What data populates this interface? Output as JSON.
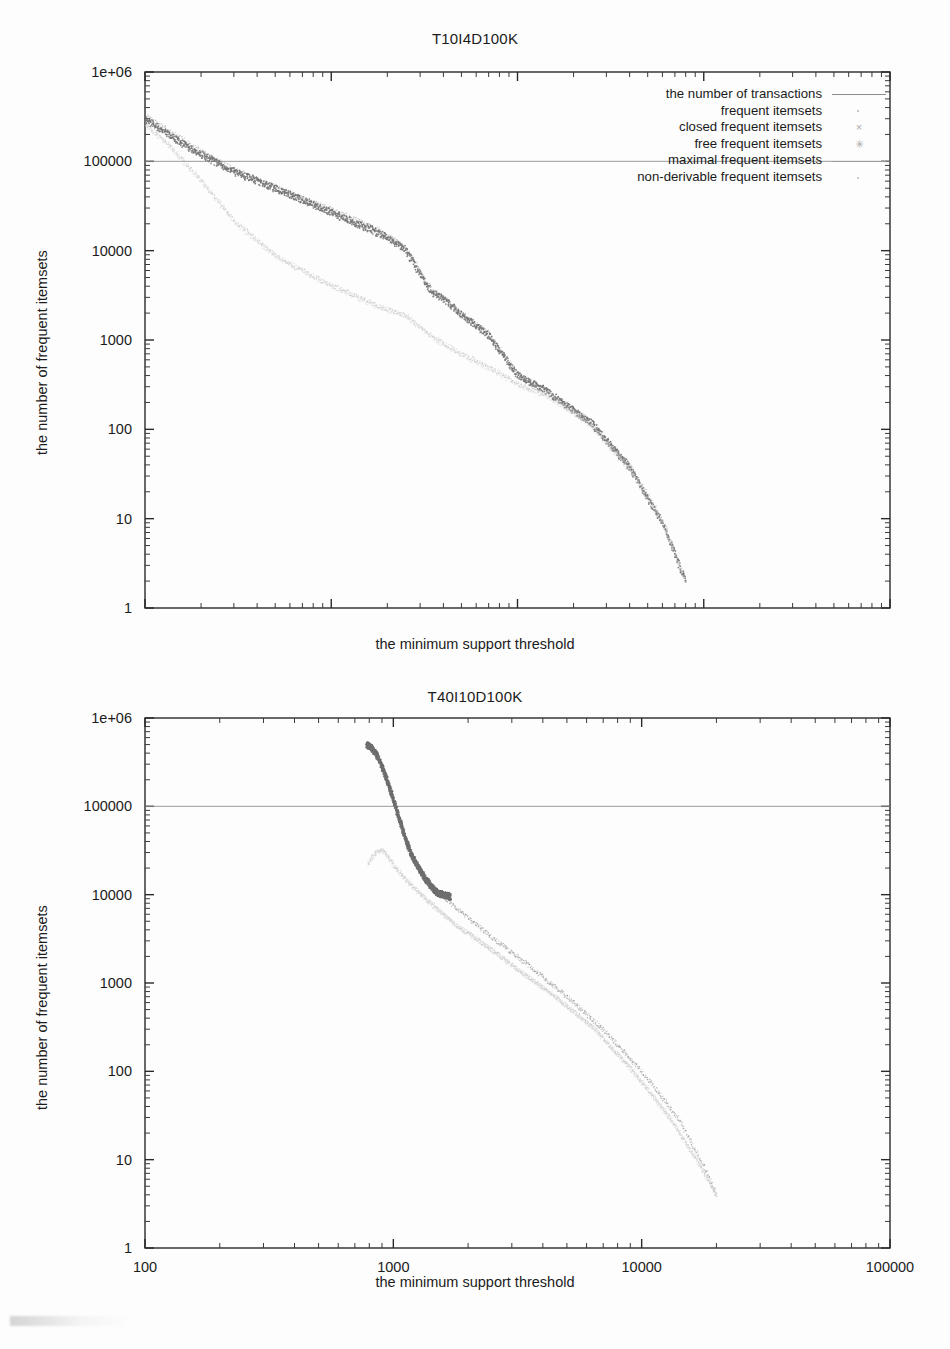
{
  "page": {
    "background_color": "#fdfdfd",
    "width": 950,
    "height": 1349
  },
  "figures": [
    {
      "id": "figure-1",
      "title": "T10I4D100K",
      "xlabel": "the minimum support threshold",
      "ylabel": "the number of frequent itemsets"
    },
    {
      "id": "figure-2",
      "title": "T40I10D100K",
      "xlabel": "the minimum support threshold",
      "ylabel": "the number of frequent itemsets"
    }
  ],
  "legend": {
    "items": [
      {
        "label": "the number of transactions",
        "marker": "line",
        "glyph": "",
        "color": "#8f8f8f"
      },
      {
        "label": "frequent itemsets",
        "marker": "dot",
        "glyph": "·",
        "color": "#b5b5b5"
      },
      {
        "label": "closed frequent itemsets",
        "marker": "cross",
        "glyph": "×",
        "color": "#a9a9a9"
      },
      {
        "label": "free frequent itemsets",
        "marker": "star",
        "glyph": "✳",
        "color": "#a9a9a9"
      },
      {
        "label": "maximal frequent itemsets",
        "marker": "line",
        "glyph": "",
        "color": "#9a9a9a"
      },
      {
        "label": "non-derivable frequent itemsets",
        "marker": "dot",
        "glyph": "·",
        "color": "#bdbdbd"
      }
    ]
  },
  "chart_data": [
    {
      "type": "scatter",
      "title": "T10I4D100K",
      "xlabel": "the minimum support threshold",
      "ylabel": "the number of frequent itemsets",
      "xscale": "log",
      "yscale": "log",
      "xlim": [
        10,
        100000
      ],
      "ylim": [
        1,
        1000000
      ],
      "xticks": [
        10,
        100,
        1000,
        10000,
        100000
      ],
      "xticklabels": [
        "10",
        "100",
        "1000",
        "10000",
        "100000"
      ],
      "yticks": [
        1,
        10,
        100,
        1000,
        10000,
        100000,
        1000000
      ],
      "yticklabels": [
        "1",
        "10",
        "100",
        "1000",
        "10000",
        "100000",
        "1e+06"
      ],
      "grid": false,
      "legend_position": "top-right",
      "series": [
        {
          "name": "the number of transactions",
          "marker": "line",
          "color": "#8f8f8f",
          "x": [
            10,
            100000
          ],
          "y": [
            100000,
            100000
          ]
        },
        {
          "name": "frequent itemsets",
          "marker": "dot",
          "color": "#9c9c9c",
          "x": [
            10,
            14,
            20,
            30,
            50,
            80,
            120,
            180,
            250,
            300,
            350,
            400,
            500,
            700,
            1000,
            1500,
            2500,
            4000,
            6000,
            8000
          ],
          "y": [
            330000,
            210000,
            130000,
            82000,
            52000,
            35000,
            25000,
            17000,
            11000,
            6000,
            3600,
            3000,
            2000,
            1200,
            420,
            260,
            120,
            40,
            10,
            2
          ]
        },
        {
          "name": "closed frequent itemsets",
          "marker": "cross",
          "color": "#6a6a6a",
          "x": [
            10,
            14,
            20,
            30,
            50,
            80,
            120,
            180,
            250,
            300,
            350,
            400,
            500,
            700,
            1000,
            1500,
            2500,
            4000,
            6000,
            8000
          ],
          "y": [
            300000,
            190000,
            120000,
            78000,
            50000,
            33000,
            23000,
            16000,
            10500,
            5500,
            3400,
            2900,
            1950,
            1150,
            410,
            255,
            118,
            38,
            9,
            2
          ]
        },
        {
          "name": "free frequent itemsets",
          "marker": "star",
          "color": "#777777",
          "x": [
            10,
            14,
            20,
            30,
            50,
            80,
            120,
            180,
            250,
            300,
            350,
            400,
            500,
            700,
            1000,
            1500,
            2500,
            4000,
            6000,
            8000
          ],
          "y": [
            290000,
            185000,
            118000,
            76000,
            49000,
            32500,
            22500,
            15500,
            10200,
            5400,
            3350,
            2850,
            1900,
            1120,
            405,
            250,
            115,
            37,
            9,
            2
          ]
        },
        {
          "name": "maximal frequent itemsets",
          "marker": "dot",
          "color": "#bcbcbc",
          "x": [
            10,
            14,
            20,
            30,
            50,
            80,
            120,
            180,
            250,
            350,
            500,
            700,
            1000,
            1500,
            2500,
            4000,
            6000,
            8000
          ],
          "y": [
            270000,
            140000,
            62000,
            22000,
            9000,
            5200,
            3500,
            2400,
            1900,
            1100,
            700,
            500,
            330,
            230,
            110,
            36,
            9,
            2
          ]
        },
        {
          "name": "non-derivable frequent itemsets",
          "marker": "dot",
          "color": "#cccccc",
          "x": [
            10,
            14,
            20,
            30,
            50,
            80,
            120,
            180,
            250,
            350,
            500,
            700,
            1000,
            1500,
            2500,
            4000,
            6000,
            8000
          ],
          "y": [
            260000,
            135000,
            60000,
            21000,
            8600,
            5000,
            3400,
            2300,
            1850,
            1050,
            680,
            480,
            320,
            225,
            108,
            35,
            9,
            2
          ]
        }
      ]
    },
    {
      "type": "scatter",
      "title": "T40I10D100K",
      "xlabel": "the minimum support threshold",
      "ylabel": "the number of frequent itemsets",
      "xscale": "log",
      "yscale": "log",
      "xlim": [
        100,
        100000
      ],
      "ylim": [
        1,
        1000000
      ],
      "xticks": [
        100,
        1000,
        10000,
        100000
      ],
      "xticklabels": [
        "100",
        "1000",
        "10000",
        "100000"
      ],
      "yticks": [
        1,
        10,
        100,
        1000,
        10000,
        100000,
        1000000
      ],
      "yticklabels": [
        "1",
        "10",
        "100",
        "1000",
        "10000",
        "100000",
        "1e+06"
      ],
      "grid": false,
      "legend_position": "top-right",
      "series": [
        {
          "name": "the number of transactions",
          "marker": "line",
          "color": "#8f8f8f",
          "x": [
            100,
            100000
          ],
          "y": [
            100000,
            100000
          ]
        },
        {
          "name": "frequent itemsets",
          "marker": "dot",
          "color": "#8a8a8a",
          "x": [
            780,
            820,
            870,
            920,
            980,
            1050,
            1120,
            1200,
            1350,
            1500,
            1700,
            2000,
            2600,
            3500,
            5000,
            7000,
            10000,
            14000,
            18000,
            20000
          ],
          "y": [
            520000,
            480000,
            380000,
            250000,
            150000,
            80000,
            45000,
            28000,
            16000,
            11000,
            8000,
            5500,
            3000,
            1600,
            700,
            300,
            100,
            30,
            8,
            4
          ]
        },
        {
          "name": "closed frequent itemsets",
          "marker": "cross",
          "color": "#5e5e5e",
          "x": [
            780,
            820,
            870,
            920,
            980,
            1050,
            1120,
            1200,
            1350,
            1500,
            1700
          ],
          "y": [
            500000,
            460000,
            360000,
            240000,
            145000,
            78000,
            43000,
            26000,
            15000,
            10500,
            9500
          ]
        },
        {
          "name": "free frequent itemsets",
          "marker": "star",
          "color": "#707070",
          "x": [
            780,
            820,
            870,
            920,
            980,
            1050,
            1120,
            1200,
            1350,
            1500,
            1700
          ],
          "y": [
            490000,
            455000,
            355000,
            235000,
            142000,
            76000,
            42000,
            25500,
            14800,
            10400,
            9400
          ]
        },
        {
          "name": "maximal frequent itemsets",
          "marker": "dot",
          "color": "#c0c0c0",
          "x": [
            790,
            850,
            900,
            950,
            1000,
            1100,
            1250,
            1500,
            1800,
            2400,
            3200,
            4500,
            6500,
            9000,
            13000,
            17000,
            20000
          ],
          "y": [
            23000,
            30000,
            32000,
            28000,
            22000,
            16000,
            11000,
            7000,
            4500,
            2600,
            1400,
            700,
            300,
            110,
            30,
            9,
            4
          ]
        },
        {
          "name": "non-derivable frequent itemsets",
          "marker": "dot",
          "color": "#cfcfcf",
          "x": [
            790,
            850,
            900,
            950,
            1000,
            1100,
            1250,
            1500,
            1800,
            2400,
            3200,
            4500,
            6500,
            9000,
            13000,
            17000,
            20000
          ],
          "y": [
            22000,
            29000,
            31000,
            27000,
            21500,
            15500,
            10700,
            6800,
            4400,
            2550,
            1380,
            690,
            295,
            108,
            29,
            9,
            4
          ]
        }
      ]
    }
  ]
}
